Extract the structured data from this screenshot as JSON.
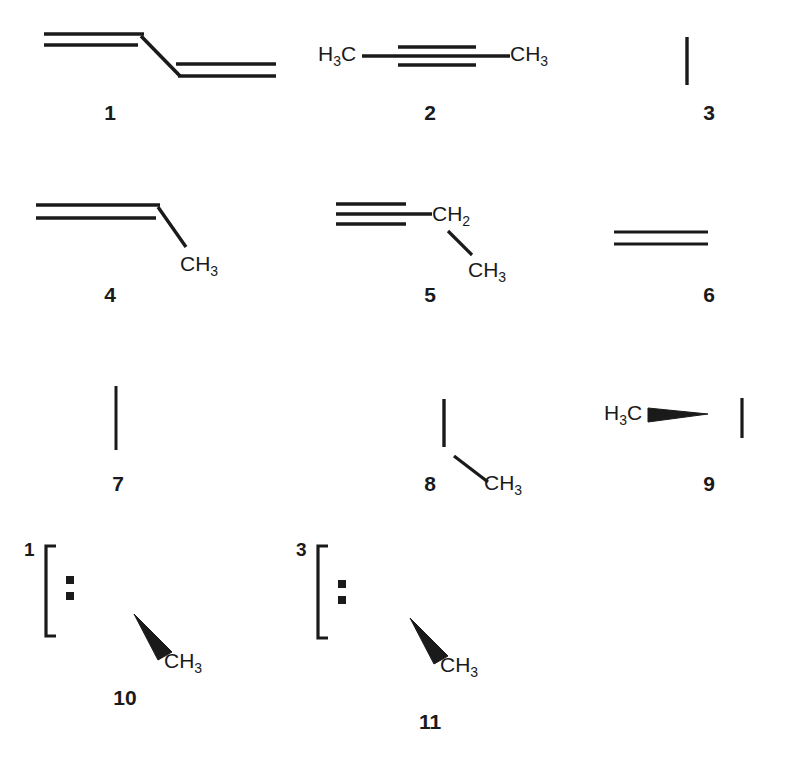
{
  "page": {
    "background_color": "#ffffff",
    "ink_color": "#1a1a1a",
    "width": 793,
    "height": 763,
    "kind": "chemical-structure-plate"
  },
  "structures": [
    {
      "id": "1",
      "label": "1",
      "name": "s-trans-1,3-butadiene",
      "atom_labels": [],
      "multiplicity": ""
    },
    {
      "id": "2",
      "label": "2",
      "name": "2-butyne",
      "atom_labels": [
        "H3C",
        "CH3"
      ],
      "multiplicity": ""
    },
    {
      "id": "3",
      "label": "3",
      "name": "cyclobutene",
      "atom_labels": [],
      "multiplicity": ""
    },
    {
      "id": "4",
      "label": "4",
      "name": "1,2-butadiene",
      "atom_labels": [
        "CH3"
      ],
      "multiplicity": ""
    },
    {
      "id": "5",
      "label": "5",
      "name": "1-butyne",
      "atom_labels": [
        "CH2",
        "CH3"
      ],
      "multiplicity": ""
    },
    {
      "id": "6",
      "label": "6",
      "name": "methylenecyclopropane",
      "atom_labels": [],
      "multiplicity": ""
    },
    {
      "id": "7",
      "label": "7",
      "name": "bicyclo[1.1.0]butane",
      "atom_labels": [],
      "multiplicity": ""
    },
    {
      "id": "8",
      "label": "8",
      "name": "1-methylcyclopropene",
      "atom_labels": [
        "CH3"
      ],
      "multiplicity": ""
    },
    {
      "id": "9",
      "label": "9",
      "name": "3-methylcyclopropene",
      "atom_labels": [
        "H3C"
      ],
      "multiplicity": ""
    },
    {
      "id": "10",
      "label": "10",
      "name": "singlet methylcyclopropylidene carbene",
      "atom_labels": [
        "CH3"
      ],
      "multiplicity": "1"
    },
    {
      "id": "11",
      "label": "11",
      "name": "triplet methylcyclopropylidene carbene",
      "atom_labels": [
        "CH3"
      ],
      "multiplicity": "3"
    }
  ],
  "atoms": {
    "h3c": {
      "main": "H",
      "sub": "3",
      "tail": "C"
    },
    "ch3": {
      "main": "CH",
      "sub": "3"
    },
    "ch2": {
      "main": "CH",
      "sub": "2"
    }
  }
}
